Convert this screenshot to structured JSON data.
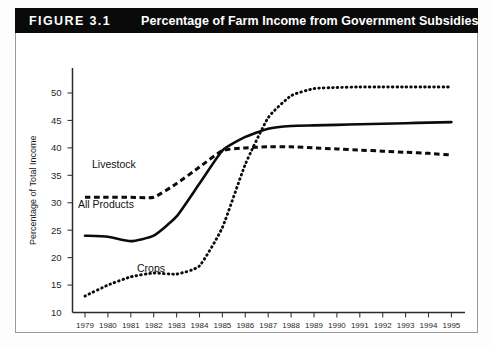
{
  "figure": {
    "number_label": "FIGURE 3.1",
    "title": "Percentage of Farm Income from Government Subsidies*"
  },
  "axes": {
    "ylabel": "Percentage of Total Income",
    "ytick_labels": [
      "50",
      "45",
      "40",
      "35",
      "30",
      "25",
      "20",
      "15",
      "10"
    ],
    "xtick_labels": [
      "1979",
      "1980",
      "1981",
      "1982",
      "1983",
      "1984",
      "1985",
      "1986",
      "1987",
      "1988",
      "1989",
      "1990",
      "1991",
      "1992",
      "1993",
      "1994",
      "1995"
    ]
  },
  "series_labels": {
    "livestock": "Livestock",
    "all_products": "All Products",
    "crops": "Crops"
  },
  "colors": {
    "ink": "#0b0b0b",
    "title_bar": "#0a0a0a",
    "title_text": "#ffffff",
    "frame": "#9a9a9a"
  },
  "chart_data": {
    "type": "line",
    "title": "Percentage of Farm Income from Government Subsidies*",
    "xlabel": "",
    "ylabel": "Percentage of Total Income",
    "xlim": [
      1979,
      1995
    ],
    "ylim": [
      10,
      52
    ],
    "yticks": [
      10,
      15,
      20,
      25,
      30,
      35,
      40,
      45,
      50
    ],
    "grid": false,
    "legend": "inline-labels",
    "x": [
      1979,
      1980,
      1981,
      1982,
      1983,
      1984,
      1985,
      1986,
      1987,
      1988,
      1989,
      1990,
      1991,
      1992,
      1993,
      1994,
      1995
    ],
    "series": [
      {
        "name": "Livestock",
        "style": "dashed",
        "values": [
          31.0,
          31.0,
          31.0,
          31.0,
          33.5,
          36.5,
          39.5,
          40.0,
          40.2,
          40.2,
          40.0,
          39.8,
          39.6,
          39.4,
          39.2,
          39.0,
          38.7
        ]
      },
      {
        "name": "All Products",
        "style": "solid",
        "values": [
          24.0,
          23.8,
          23.0,
          24.0,
          27.5,
          33.5,
          39.5,
          42.0,
          43.5,
          44.0,
          44.1,
          44.2,
          44.3,
          44.4,
          44.5,
          44.6,
          44.7
        ]
      },
      {
        "name": "Crops",
        "style": "dotted",
        "values": [
          13.0,
          15.0,
          16.5,
          17.2,
          17.0,
          18.5,
          25.5,
          37.0,
          45.5,
          49.5,
          50.8,
          51.0,
          51.1,
          51.1,
          51.1,
          51.1,
          51.1
        ]
      }
    ]
  }
}
